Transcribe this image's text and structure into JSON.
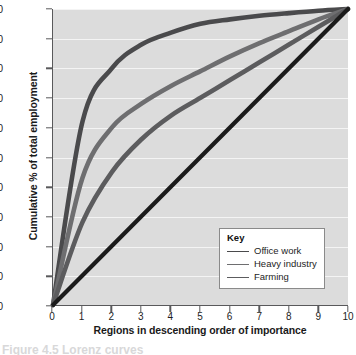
{
  "chart_data": {
    "type": "line",
    "title": "",
    "xlabel": "Regions in descending order of importance",
    "ylabel": "Cumulative % of total employment",
    "xlim": [
      0,
      10
    ],
    "ylim": [
      0,
      100
    ],
    "xticks": [
      "0",
      "1",
      "2",
      "3",
      "4",
      "5",
      "6",
      "7",
      "8",
      "9",
      "10"
    ],
    "yticks": [
      "0",
      "10",
      "20",
      "30",
      "40",
      "50",
      "60",
      "70",
      "80",
      "90",
      "100"
    ],
    "grid": "horizontal",
    "legend_position": "lower-right",
    "legend_title": "Key",
    "x": [
      0,
      1,
      2,
      3,
      4,
      5,
      6,
      7,
      8,
      9,
      10
    ],
    "series": [
      {
        "name": "Office work",
        "color": "#4a4a4c",
        "values": [
          0,
          62,
          80,
          88,
          92,
          95,
          96.5,
          97.7,
          98.6,
          99.4,
          100
        ]
      },
      {
        "name": "Heavy industry",
        "color": "#6e6e70",
        "values": [
          0,
          43,
          60,
          68,
          74,
          79,
          84,
          88.5,
          92.5,
          96.5,
          100
        ]
      },
      {
        "name": "Farming",
        "color": "#5c5c5e",
        "values": [
          0,
          28,
          45,
          56,
          64,
          70,
          76,
          82,
          88,
          94,
          100
        ]
      },
      {
        "name": "Line of equality",
        "color": "#1b1b1b",
        "values": [
          0,
          10,
          20,
          30,
          40,
          50,
          60,
          70,
          80,
          90,
          100
        ]
      }
    ],
    "legend_entries": [
      {
        "label": "Office work",
        "color": "#4a4a4c"
      },
      {
        "label": "Heavy industry",
        "color": "#6e6e70"
      },
      {
        "label": "Farming",
        "color": "#5c5c5e"
      }
    ],
    "colors": {
      "plot_background": "#dcdcdc",
      "gridline": "#f4f4f4",
      "axis": "#59595b",
      "text": "#1d1d1d"
    }
  },
  "caption": {
    "text": "Figure 4.5 Lorenz curves"
  }
}
